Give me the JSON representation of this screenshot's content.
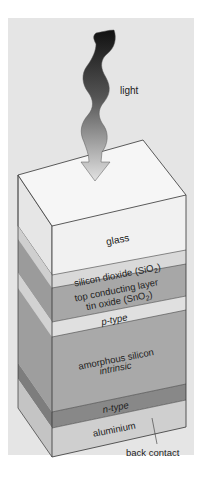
{
  "diagram": {
    "light_label": "light",
    "layers": [
      {
        "id": "glass",
        "label": "glass",
        "color": "#f1f1f1",
        "side_color": "#e2e2e2"
      },
      {
        "id": "sio2",
        "label": "silicon dioxide (SiO",
        "sub": "2",
        "suffix": ")",
        "color": "#d9d9d9",
        "side_color": "#cacaca"
      },
      {
        "id": "sno2",
        "label_line1": "top conducting layer",
        "label_line2": "tin oxide (SnO",
        "sub": "2",
        "suffix": ")",
        "color": "#a7a7a7",
        "side_color": "#999999"
      },
      {
        "id": "ptype",
        "label": "p-type",
        "color": "#dedede",
        "side_color": "#cfcfcf"
      },
      {
        "id": "amorphous",
        "label_line1": "amorphous silicon",
        "label_line2": "intrinsic",
        "color": "#a9a9a9",
        "side_color": "#9b9b9b"
      },
      {
        "id": "ntype",
        "label": "n-type",
        "color": "#888888",
        "side_color": "#7b7b7b"
      },
      {
        "id": "aluminium",
        "label": "aluminium",
        "color": "#cfcfcf",
        "side_color": "#c2c2c2"
      }
    ],
    "back_contact_label": "back contact",
    "colors": {
      "panel": "#e5e5e5",
      "top_face": "#f6f6f6",
      "edge": "#333333",
      "arrow_top": "#111111",
      "arrow_bottom": "#dcdcdc"
    }
  }
}
